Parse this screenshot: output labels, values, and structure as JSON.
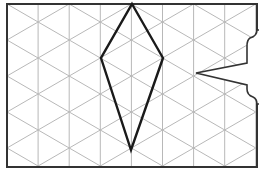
{
  "diagram": {
    "type": "isometric-grid-with-kite",
    "grid": {
      "frame": {
        "x": 7,
        "y": 4,
        "right": 257,
        "bottom": 167
      },
      "column_spacing": 31.1,
      "row_period": 36,
      "line_color": "#b8b8b8",
      "frame_color": "#333333"
    },
    "kite": {
      "vertices": [
        [
          132,
          4
        ],
        [
          163,
          58
        ],
        [
          131,
          150
        ],
        [
          101,
          58
        ]
      ],
      "stroke": "#1a1a1a",
      "stroke_width": 2.4
    },
    "speech_bubble": {
      "tail_tip": [
        196,
        73
      ],
      "stroke": "#333333",
      "fill": "#ffffff"
    }
  }
}
